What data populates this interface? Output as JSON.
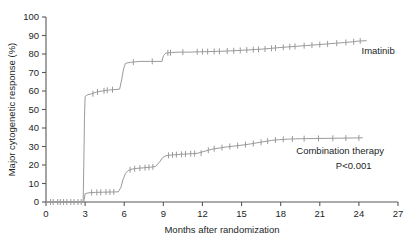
{
  "chart_data": {
    "type": "line",
    "title": "",
    "xlabel": "Months after randomization",
    "ylabel": "Major cytogenetic response (%)",
    "xlim": [
      0,
      27
    ],
    "ylim": [
      0,
      100
    ],
    "xticks": [
      0,
      3,
      6,
      9,
      12,
      15,
      18,
      21,
      24,
      27
    ],
    "yticks": [
      0,
      10,
      20,
      30,
      40,
      50,
      60,
      70,
      80,
      90,
      100
    ],
    "xtick_labels": [
      "0",
      "3",
      "6",
      "9",
      "12",
      "15",
      "18",
      "21",
      "24",
      "27"
    ],
    "ytick_labels": [
      "0",
      "10",
      "20",
      "30",
      "40",
      "50",
      "60",
      "70",
      "80",
      "90",
      "100"
    ],
    "grid": false,
    "legend_position": "inline-right",
    "annotations": [
      {
        "name": "p-value",
        "text": "P<0.001",
        "x": 23.6,
        "y": 18
      }
    ],
    "series": [
      {
        "name": "Imatinib",
        "color": "#9a9a9c",
        "label": "Imatinib",
        "label_x": 24.2,
        "label_y": 80,
        "points": [
          [
            0,
            0
          ],
          [
            2.85,
            0
          ],
          [
            2.9,
            20
          ],
          [
            2.95,
            45
          ],
          [
            3.0,
            57
          ],
          [
            3.2,
            58
          ],
          [
            3.5,
            58.5
          ],
          [
            3.9,
            59.5
          ],
          [
            4.3,
            60
          ],
          [
            4.8,
            60.5
          ],
          [
            5.3,
            60.8
          ],
          [
            5.65,
            61
          ],
          [
            5.8,
            66
          ],
          [
            5.95,
            72
          ],
          [
            6.1,
            75
          ],
          [
            6.5,
            75.5
          ],
          [
            7.2,
            76
          ],
          [
            8.0,
            76
          ],
          [
            8.6,
            76
          ],
          [
            8.9,
            76
          ],
          [
            9.0,
            79
          ],
          [
            9.2,
            80.5
          ],
          [
            9.6,
            80.8
          ],
          [
            10.2,
            81
          ],
          [
            11.0,
            81
          ],
          [
            11.8,
            81.2
          ],
          [
            12.5,
            81.3
          ],
          [
            13.5,
            81.5
          ],
          [
            14.5,
            81.8
          ],
          [
            15.5,
            82.2
          ],
          [
            16.5,
            82.6
          ],
          [
            17.2,
            83.0
          ],
          [
            17.8,
            83.4
          ],
          [
            18.5,
            83.8
          ],
          [
            19.3,
            84.2
          ],
          [
            20.0,
            84.6
          ],
          [
            20.8,
            85.0
          ],
          [
            21.5,
            85.4
          ],
          [
            22.2,
            85.8
          ],
          [
            22.9,
            86.2
          ],
          [
            23.5,
            86.6
          ],
          [
            24.0,
            87.0
          ],
          [
            24.6,
            87.2
          ]
        ],
        "censor_marks": [
          [
            3.6,
            58.5
          ],
          [
            3.95,
            59.5
          ],
          [
            4.45,
            60.1
          ],
          [
            4.7,
            60.4
          ],
          [
            5.1,
            60.7
          ],
          [
            6.7,
            75.6
          ],
          [
            8.15,
            76.0
          ],
          [
            9.35,
            80.6
          ],
          [
            9.55,
            80.7
          ],
          [
            10.5,
            81.0
          ],
          [
            11.6,
            81.2
          ],
          [
            12.0,
            81.25
          ],
          [
            12.4,
            81.3
          ],
          [
            12.9,
            81.4
          ],
          [
            13.3,
            81.45
          ],
          [
            13.9,
            81.6
          ],
          [
            14.4,
            81.75
          ],
          [
            14.9,
            81.9
          ],
          [
            15.4,
            82.15
          ],
          [
            15.9,
            82.35
          ],
          [
            16.3,
            82.5
          ],
          [
            16.8,
            82.7
          ],
          [
            17.3,
            83.05
          ],
          [
            17.6,
            83.25
          ],
          [
            18.2,
            83.65
          ],
          [
            18.7,
            83.9
          ],
          [
            19.1,
            84.1
          ],
          [
            19.8,
            84.5
          ],
          [
            20.4,
            84.8
          ],
          [
            21.0,
            85.1
          ],
          [
            21.6,
            85.45
          ],
          [
            22.3,
            85.85
          ],
          [
            23.0,
            86.25
          ],
          [
            23.6,
            86.65
          ],
          [
            24.1,
            87.05
          ]
        ]
      },
      {
        "name": "Combination therapy",
        "color": "#9a9a9c",
        "label": "Combination therapy",
        "label_x": 19.2,
        "label_y": 26,
        "points": [
          [
            0,
            0
          ],
          [
            2.9,
            0
          ],
          [
            3.0,
            4.5
          ],
          [
            3.3,
            5.0
          ],
          [
            3.8,
            5.2
          ],
          [
            4.4,
            5.3
          ],
          [
            5.0,
            5.4
          ],
          [
            5.55,
            5.5
          ],
          [
            5.75,
            8.0
          ],
          [
            5.9,
            12.0
          ],
          [
            6.1,
            15.5
          ],
          [
            6.3,
            17.0
          ],
          [
            6.6,
            17.8
          ],
          [
            7.0,
            18.2
          ],
          [
            7.5,
            18.5
          ],
          [
            8.0,
            18.8
          ],
          [
            8.4,
            19.2
          ],
          [
            8.7,
            21.5
          ],
          [
            8.95,
            24.0
          ],
          [
            9.2,
            25.0
          ],
          [
            9.6,
            25.4
          ],
          [
            10.2,
            25.7
          ],
          [
            10.9,
            26.0
          ],
          [
            11.6,
            26.3
          ],
          [
            12.2,
            27.5
          ],
          [
            12.7,
            28.5
          ],
          [
            13.3,
            29.2
          ],
          [
            13.9,
            29.8
          ],
          [
            14.5,
            30.3
          ],
          [
            15.1,
            30.8
          ],
          [
            15.7,
            31.4
          ],
          [
            16.2,
            32.0
          ],
          [
            16.8,
            32.7
          ],
          [
            17.3,
            33.3
          ],
          [
            17.9,
            33.7
          ],
          [
            18.6,
            34.0
          ],
          [
            19.5,
            34.2
          ],
          [
            20.5,
            34.3
          ],
          [
            21.5,
            34.4
          ],
          [
            22.5,
            34.5
          ],
          [
            23.5,
            34.6
          ],
          [
            24.3,
            34.7
          ]
        ],
        "censor_marks": [
          [
            0.35,
            0
          ],
          [
            0.55,
            0
          ],
          [
            0.9,
            0
          ],
          [
            1.1,
            0
          ],
          [
            1.35,
            0
          ],
          [
            1.6,
            0
          ],
          [
            1.9,
            0
          ],
          [
            2.15,
            0
          ],
          [
            2.45,
            0
          ],
          [
            2.7,
            0
          ],
          [
            3.5,
            5.1
          ],
          [
            3.9,
            5.2
          ],
          [
            4.2,
            5.25
          ],
          [
            4.6,
            5.35
          ],
          [
            4.9,
            5.38
          ],
          [
            5.2,
            5.45
          ],
          [
            6.45,
            17.4
          ],
          [
            6.8,
            18.0
          ],
          [
            7.2,
            18.3
          ],
          [
            7.6,
            18.55
          ],
          [
            7.9,
            18.75
          ],
          [
            8.2,
            19.0
          ],
          [
            9.4,
            25.2
          ],
          [
            9.7,
            25.45
          ],
          [
            10.0,
            25.6
          ],
          [
            10.4,
            25.75
          ],
          [
            10.7,
            25.9
          ],
          [
            11.1,
            26.1
          ],
          [
            11.4,
            26.2
          ],
          [
            11.9,
            26.4
          ],
          [
            12.45,
            28.0
          ],
          [
            12.9,
            28.8
          ],
          [
            13.5,
            29.4
          ],
          [
            14.1,
            30.0
          ],
          [
            14.7,
            30.5
          ],
          [
            15.3,
            31.0
          ],
          [
            15.9,
            31.6
          ],
          [
            16.5,
            32.3
          ],
          [
            17.0,
            32.9
          ],
          [
            17.6,
            33.5
          ],
          [
            18.2,
            33.85
          ],
          [
            18.9,
            34.1
          ],
          [
            19.8,
            34.25
          ],
          [
            20.9,
            34.35
          ],
          [
            22.0,
            34.45
          ],
          [
            23.0,
            34.55
          ],
          [
            24.0,
            34.68
          ]
        ]
      }
    ]
  },
  "labels": {
    "y_axis_title": "Major cytogenetic response (%)",
    "x_axis_title": "Months after randomization",
    "imatinib": "Imatinib",
    "combination": "Combination therapy",
    "pvalue": "P<0.001"
  }
}
